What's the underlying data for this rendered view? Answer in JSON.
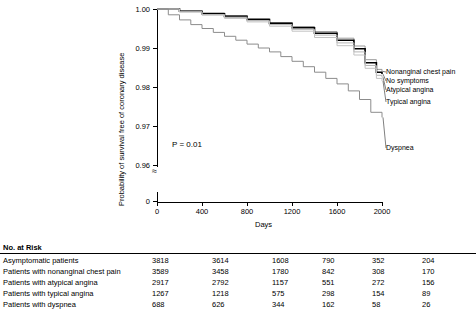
{
  "chart_data": {
    "type": "line",
    "title": "",
    "xlabel": "Days",
    "ylabel": "Probability of survival free of coronary disease",
    "xlim": [
      0,
      2000
    ],
    "ylim": [
      0.955,
      1.0
    ],
    "xticks": [
      0,
      400,
      800,
      1200,
      1600,
      2000
    ],
    "yticks": [
      "1.00",
      "0.99",
      "0.98",
      "0.97",
      "0.96",
      "0"
    ],
    "grid": false,
    "legend_position": "inline-right",
    "annotations": [
      "P = 0.01"
    ],
    "series": [
      {
        "name": "Nonanginal chest pain",
        "color": "#9a9a9a",
        "x": [
          0,
          200,
          400,
          600,
          800,
          1000,
          1200,
          1400,
          1600,
          1750,
          1850,
          1950,
          2000
        ],
        "y": [
          1.0,
          0.9995,
          0.999,
          0.9983,
          0.9975,
          0.9965,
          0.9955,
          0.9942,
          0.9925,
          0.9905,
          0.987,
          0.9845,
          0.984
        ]
      },
      {
        "name": "No symptoms",
        "color": "#000000",
        "x": [
          0,
          200,
          400,
          600,
          800,
          1000,
          1200,
          1400,
          1600,
          1750,
          1850,
          1950,
          2000
        ],
        "y": [
          1.0,
          0.9994,
          0.9988,
          0.9981,
          0.9973,
          0.9963,
          0.9952,
          0.9938,
          0.992,
          0.9898,
          0.9862,
          0.9838,
          0.9833
        ]
      },
      {
        "name": "Atypical angina",
        "color": "#b5b5b5",
        "x": [
          0,
          200,
          400,
          600,
          800,
          1000,
          1200,
          1400,
          1600,
          1750,
          1850,
          1950,
          2000
        ],
        "y": [
          1.0,
          0.9993,
          0.9986,
          0.9979,
          0.997,
          0.996,
          0.9948,
          0.9933,
          0.9913,
          0.989,
          0.9855,
          0.983,
          0.9825
        ]
      },
      {
        "name": "Typical angina",
        "color": "#c2c2c2",
        "x": [
          0,
          200,
          400,
          600,
          800,
          1000,
          1200,
          1400,
          1600,
          1750,
          1850,
          1950,
          2000
        ],
        "y": [
          1.0,
          0.9992,
          0.9984,
          0.9976,
          0.9967,
          0.9956,
          0.9943,
          0.9927,
          0.9906,
          0.9882,
          0.9848,
          0.9822,
          0.9815
        ]
      },
      {
        "name": "Dyspnea",
        "color": "#8c8c8c",
        "x": [
          0,
          100,
          200,
          300,
          400,
          500,
          600,
          700,
          800,
          900,
          1000,
          1100,
          1200,
          1300,
          1400,
          1500,
          1600,
          1700,
          1800,
          1900,
          2000
        ],
        "y": [
          1.0,
          0.9985,
          0.9972,
          0.996,
          0.995,
          0.994,
          0.993,
          0.992,
          0.991,
          0.99,
          0.989,
          0.9878,
          0.9866,
          0.9852,
          0.9838,
          0.9822,
          0.9808,
          0.979,
          0.9768,
          0.9735,
          0.9722
        ]
      }
    ]
  },
  "axis": {
    "y_label": "Probability of survival free of coronary disease",
    "x_label": "Days",
    "y_ticks": [
      "1.00",
      "0.99",
      "0.98",
      "0.97",
      "0.96",
      "0"
    ],
    "x_ticks": [
      "0",
      "400",
      "800",
      "1200",
      "1600",
      "2000"
    ]
  },
  "annotation": {
    "pvalue": "P = 0.01"
  },
  "curve_labels": [
    "Nonanginal chest pain",
    "No symptoms",
    "Atypical angina",
    "Typical angina",
    "Dyspnea"
  ],
  "risk_table": {
    "title": "No. at Risk",
    "rows": [
      {
        "label": "Asymptomatic patients",
        "values": [
          "3818",
          "3614",
          "1608",
          "790",
          "352",
          "204"
        ]
      },
      {
        "label": "Patients with nonanginal chest pain",
        "values": [
          "3589",
          "3458",
          "1780",
          "842",
          "308",
          "170"
        ]
      },
      {
        "label": "Patients with atypical angina",
        "values": [
          "2917",
          "2792",
          "1157",
          "551",
          "272",
          "156"
        ]
      },
      {
        "label": "Patients with typical angina",
        "values": [
          "1267",
          "1218",
          "575",
          "298",
          "154",
          "89"
        ]
      },
      {
        "label": "Patients with dyspnea",
        "values": [
          "688",
          "626",
          "344",
          "162",
          "58",
          "26"
        ]
      }
    ]
  }
}
